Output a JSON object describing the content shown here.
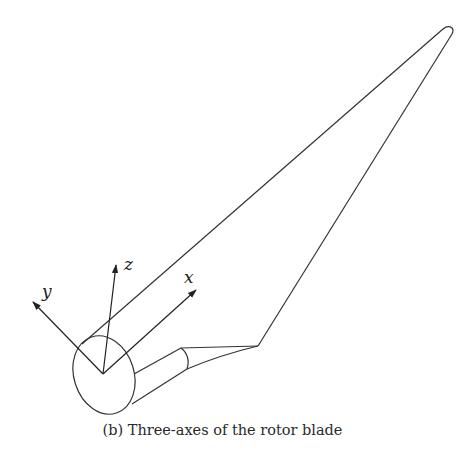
{
  "figure": {
    "caption": "(b) Three-axes of the rotor blade",
    "axes": {
      "x": "x",
      "y": "y",
      "z": "z"
    },
    "colors": {
      "stroke": "#333333",
      "background": "#ffffff"
    }
  }
}
